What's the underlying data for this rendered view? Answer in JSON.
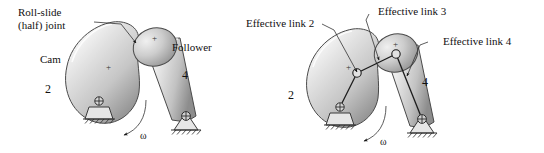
{
  "figure": {
    "title_text": "",
    "panels": [
      {
        "id": "left",
        "name": "cam-follower-physical",
        "labels": {
          "callout": "Roll-slide\n(half) joint",
          "callout_line1": "Roll-slide",
          "callout_line2": "(half) joint",
          "cam": "Cam",
          "follower": "Follower",
          "link2_number": "2",
          "link4_number": "4",
          "omega": "ω",
          "plus_cam": "+",
          "plus_follower": "+"
        }
      },
      {
        "id": "right",
        "name": "effective-linkage-equivalent",
        "labels": {
          "effective_link_2": "Effective link 2",
          "effective_link_3": "Effective link 3",
          "effective_link_4": "Effective link 4",
          "link2_number": "2",
          "link4_number": "4",
          "omega": "ω",
          "plus_cam": "+",
          "plus_follower": "+"
        }
      }
    ]
  },
  "colors": {
    "background": "#ffffff",
    "body_fill_light": "#f2f2f2",
    "body_fill_mid": "#cfcfcf",
    "body_fill_dark": "#9a9a9a",
    "outline": "#4a4a4a",
    "text": "#111111",
    "leader": "#333333"
  }
}
